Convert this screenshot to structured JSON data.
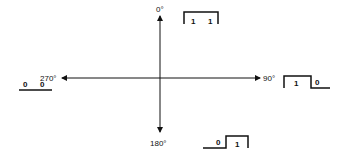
{
  "angles": {
    "top": "0°",
    "right": "90°",
    "bottom": "180°",
    "left": "270°"
  },
  "waveforms": {
    "top": {
      "bits": [
        "1",
        "1"
      ]
    },
    "right": {
      "bits": [
        "1",
        "0"
      ]
    },
    "bottom": {
      "bits": [
        "0",
        "1"
      ]
    },
    "left": {
      "bits": [
        "0",
        "0"
      ]
    }
  },
  "colors": {
    "ink": "#111111",
    "background": "#ffffff"
  }
}
